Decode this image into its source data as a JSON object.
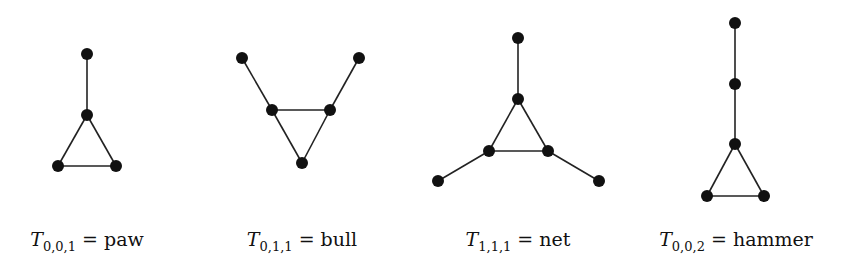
{
  "figure": {
    "graphs": [
      {
        "id": "paw",
        "symbol": "T",
        "subscript": "0,0,1",
        "eq": " = ",
        "name": "paw",
        "label_x": 87,
        "nodes": [
          [
            87,
            54
          ],
          [
            87,
            115
          ],
          [
            58,
            166
          ],
          [
            116,
            166
          ]
        ],
        "edges": [
          [
            0,
            1
          ],
          [
            1,
            2
          ],
          [
            1,
            3
          ],
          [
            2,
            3
          ]
        ]
      },
      {
        "id": "bull",
        "symbol": "T",
        "subscript": "0,1,1",
        "eq": " = ",
        "name": "bull",
        "label_x": 302,
        "nodes": [
          [
            242,
            58
          ],
          [
            359,
            58
          ],
          [
            272,
            110
          ],
          [
            330,
            110
          ],
          [
            302,
            163
          ]
        ],
        "edges": [
          [
            0,
            2
          ],
          [
            1,
            3
          ],
          [
            2,
            3
          ],
          [
            2,
            4
          ],
          [
            3,
            4
          ]
        ]
      },
      {
        "id": "net",
        "symbol": "T",
        "subscript": "1,1,1",
        "eq": " = ",
        "name": "net",
        "label_x": 518,
        "nodes": [
          [
            518,
            38
          ],
          [
            518,
            99
          ],
          [
            489,
            151
          ],
          [
            548,
            151
          ],
          [
            438,
            181
          ],
          [
            599,
            181
          ]
        ],
        "edges": [
          [
            0,
            1
          ],
          [
            1,
            2
          ],
          [
            1,
            3
          ],
          [
            2,
            3
          ],
          [
            2,
            4
          ],
          [
            3,
            5
          ]
        ]
      },
      {
        "id": "hammer",
        "symbol": "T",
        "subscript": "0,0,2",
        "eq": " = ",
        "name": "hammer",
        "label_x": 736,
        "nodes": [
          [
            735,
            23
          ],
          [
            735,
            84
          ],
          [
            735,
            144
          ],
          [
            707,
            196
          ],
          [
            764,
            196
          ]
        ],
        "edges": [
          [
            0,
            1
          ],
          [
            1,
            2
          ],
          [
            2,
            3
          ],
          [
            2,
            4
          ],
          [
            3,
            4
          ]
        ]
      }
    ],
    "style": {
      "node_color": "#111111",
      "edge_color": "#222222",
      "node_radius": 6,
      "edge_width": 1.6
    }
  }
}
